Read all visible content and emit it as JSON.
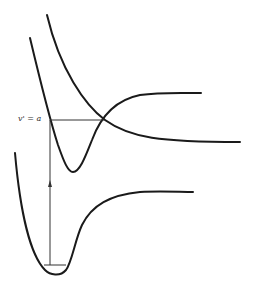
{
  "diagram": {
    "type": "potential-energy-curves",
    "label_level": "v' = a",
    "colors": {
      "curve": "#1a1a1a",
      "line": "#333333",
      "background": "#ffffff"
    },
    "curves": [
      {
        "name": "ground-state-bound",
        "description": "Lower Morse-like potential well, dissociates to plateau at right"
      },
      {
        "name": "excited-state-bound",
        "description": "Upper bound potential well with minimum near x=73"
      },
      {
        "name": "repulsive-state",
        "description": "Repulsive curve crossing excited state at v'=a"
      }
    ],
    "annotations": [
      {
        "name": "vertical-transition-arrow",
        "description": "Upward arrow from ground vibrational level to excited state"
      },
      {
        "name": "level-v-a",
        "description": "Horizontal level line at v'=a to curve crossing"
      },
      {
        "name": "ground-vibrational-level",
        "description": "Short horizontal line near bottom of ground well"
      }
    ]
  }
}
